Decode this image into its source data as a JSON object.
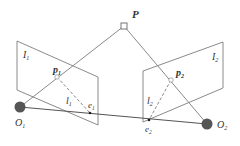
{
  "diagram": {
    "labels": {
      "P": "P",
      "I1": "I",
      "I1_sub": "1",
      "I2": "I",
      "I2_sub": "2",
      "p1": "p",
      "p1_sub": "1",
      "p2": "p",
      "p2_sub": "2",
      "l1": "l",
      "l1_sub": "1",
      "l2": "l",
      "l2_sub": "2",
      "e1": "e",
      "e1_sub": "1",
      "e2": "e",
      "e2_sub": "2",
      "O1": "O",
      "O1_sub": "1",
      "O2": "O",
      "O2_sub": "2"
    },
    "colors": {
      "line": "#8a8a8a",
      "baseline": "#555555",
      "camera": "#555555",
      "text": "#333333"
    }
  }
}
